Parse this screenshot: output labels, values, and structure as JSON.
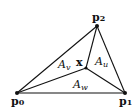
{
  "diagram": {
    "line_color": "#111111",
    "vertices": [
      {
        "id": "p0",
        "label": "p",
        "sub": "0",
        "x": 17,
        "y": 93
      },
      {
        "id": "p1",
        "label": "p",
        "sub": "1",
        "x": 125,
        "y": 93
      },
      {
        "id": "p2",
        "label": "p",
        "sub": "2",
        "x": 97,
        "y": 26
      }
    ],
    "interior_point": {
      "label": "x",
      "x": 86,
      "y": 68
    },
    "areas": [
      {
        "label": "A",
        "sub": "v"
      },
      {
        "label": "A",
        "sub": "u"
      },
      {
        "label": "A",
        "sub": "w"
      }
    ]
  }
}
